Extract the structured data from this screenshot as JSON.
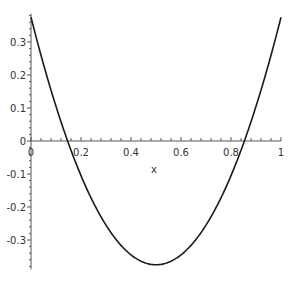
{
  "chart_data": {
    "type": "line",
    "title": "",
    "xlabel": "x",
    "ylabel": "",
    "xlim": [
      0,
      1
    ],
    "ylim": [
      -0.38,
      0.38
    ],
    "grid": false,
    "legend": null,
    "x_ticks": [
      "0",
      "0.2",
      "0.4",
      "0.6",
      "0.8",
      "1"
    ],
    "y_ticks": [
      "0.3",
      "0.2",
      "0.1",
      "0",
      "-0.1",
      "-0.2",
      "-0.3"
    ],
    "series": [
      {
        "name": "f(x)",
        "expression": "3*(x-0.5)^2 - 0.375",
        "x": [
          0,
          0.1,
          0.146,
          0.2,
          0.3,
          0.4,
          0.5,
          0.6,
          0.7,
          0.8,
          0.854,
          0.9,
          1.0
        ],
        "values": [
          0.375,
          0.105,
          0.0,
          -0.105,
          -0.255,
          -0.345,
          -0.375,
          -0.345,
          -0.255,
          -0.105,
          0.0,
          0.105,
          0.375
        ]
      }
    ],
    "line_color": "#1a1a1a"
  }
}
